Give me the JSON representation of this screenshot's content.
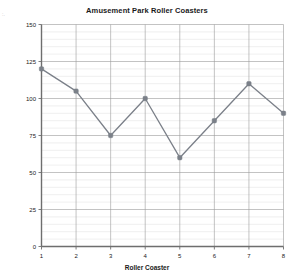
{
  "chart_data": {
    "type": "line",
    "title": "Amusement Park Roller Coasters",
    "xlabel": "Roller Coaster",
    "ylabel": "Speed (Miles per Hour)",
    "categories": [
      "1",
      "2",
      "3",
      "4",
      "5",
      "6",
      "7",
      "8"
    ],
    "values": [
      120,
      105,
      75,
      100,
      60,
      85,
      110,
      90
    ],
    "series": [
      {
        "name": "Speed",
        "values": [
          120,
          105,
          75,
          100,
          60,
          85,
          110,
          90
        ]
      }
    ],
    "ylim": [
      0,
      150
    ],
    "ytick_labels": [
      "0",
      "25",
      "50",
      "75",
      "100",
      "125",
      "150"
    ],
    "ytick_values": [
      0,
      25,
      50,
      75,
      100,
      125,
      150
    ],
    "xtick_labels": [
      "1",
      "2",
      "3",
      "4",
      "5",
      "6",
      "7",
      "8"
    ],
    "minor_gridline_step": 5,
    "grid": true,
    "legend": false,
    "legend_position": "none",
    "colors": {
      "line": "#7b8089",
      "marker": "#7b8089",
      "major_grid": "#9a9a9a",
      "minor_grid": "#dedede",
      "axis": "#6e6e6e",
      "text": "#1a1a1a",
      "background": "#ffffff"
    }
  }
}
